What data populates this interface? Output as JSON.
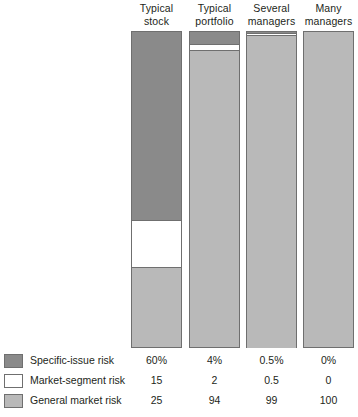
{
  "chart_data": {
    "type": "bar",
    "title": "",
    "subtitle": "",
    "xlabel": "",
    "ylabel": "",
    "ylim": [
      0,
      100
    ],
    "grid": false,
    "legend_position": "bottom-left",
    "stacked": true,
    "stack_order_top_to_bottom": [
      "Specific-issue risk",
      "Market-segment risk",
      "General market risk"
    ],
    "categories": [
      "Typical stock",
      "Typical portfolio",
      "Several managers",
      "Many managers"
    ],
    "series": [
      {
        "name": "Specific-issue risk",
        "color": "#8a8a8a",
        "values": [
          60,
          4,
          0.5,
          0
        ],
        "labels": [
          "60%",
          "4%",
          "0.5%",
          "0%"
        ]
      },
      {
        "name": "Market-segment risk",
        "color": "#ffffff",
        "values": [
          15,
          2,
          0.5,
          0
        ],
        "labels": [
          "15",
          "2",
          "0.5",
          "0"
        ]
      },
      {
        "name": "General market risk",
        "color": "#b9b9b9",
        "values": [
          25,
          94,
          99,
          100
        ],
        "labels": [
          "25",
          "94",
          "99",
          "100"
        ]
      }
    ]
  },
  "headers": [
    {
      "line1": "Typical",
      "line2": "stock"
    },
    {
      "line1": "Typical",
      "line2": "portfolio"
    },
    {
      "line1": "Several",
      "line2": "managers"
    },
    {
      "line1": "Many",
      "line2": "managers"
    }
  ],
  "legend": [
    {
      "label": "Specific-issue risk",
      "swatch": "specific"
    },
    {
      "label": "Market-segment risk",
      "swatch": "segment"
    },
    {
      "label": "General market risk",
      "swatch": "general"
    }
  ],
  "value_rows": [
    {
      "label": "Specific-issue risk",
      "cells": [
        "60%",
        "4%",
        "0.5%",
        "0%"
      ]
    },
    {
      "label": "Market-segment risk",
      "cells": [
        "15",
        "2",
        "0.5",
        "0"
      ]
    },
    {
      "label": "General market risk",
      "cells": [
        "25",
        "94",
        "99",
        "100"
      ]
    }
  ],
  "colors": {
    "specific_issue": "#8a8a8a",
    "market_segment": "#ffffff",
    "general_market": "#b9b9b9",
    "outline": "#6f6f6f",
    "text": "#231f20",
    "background": "#ffffff"
  },
  "layout": {
    "bar_left_positions": [
      131,
      189,
      246,
      303
    ],
    "bar_width": 51,
    "plot_top": 31,
    "plot_height": 317
  }
}
